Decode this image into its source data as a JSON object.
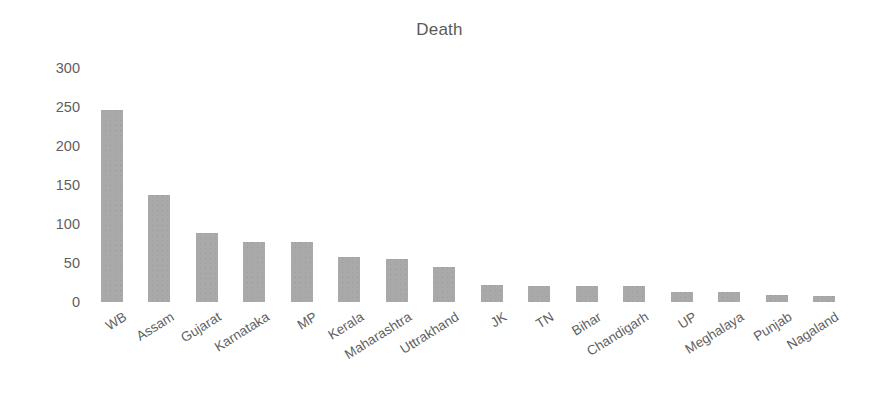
{
  "chart_data": {
    "type": "bar",
    "title": "Death",
    "xlabel": "",
    "ylabel": "",
    "ylim": [
      0,
      300
    ],
    "ytick_values": [
      300,
      250,
      200,
      150,
      100,
      50,
      0
    ],
    "ytick_labels": [
      "300",
      "250",
      "200",
      "150",
      "100",
      "50",
      "0"
    ],
    "grid": false,
    "legend": false,
    "bar_color": "#a9a9a9",
    "title_color": "#5a5a5a",
    "tick_color": "#5f5f5f",
    "categories": [
      "WB",
      "Assam",
      "Gujarat",
      "Karnataka",
      "MP",
      "Kerala",
      "Maharashtra",
      "Uttrakhand",
      "JK",
      "TN",
      "Bihar",
      "Chandigarh",
      "UP",
      "Meghalaya",
      "Punjab",
      "Nagaland"
    ],
    "values": [
      246,
      137,
      88,
      77,
      77,
      58,
      55,
      45,
      22,
      21,
      21,
      21,
      13,
      13,
      9,
      8
    ]
  }
}
